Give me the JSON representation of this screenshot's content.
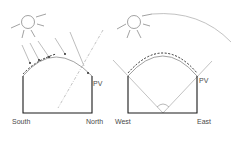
{
  "diagrams": [
    {
      "id": "north-south",
      "labels": {
        "left": "South",
        "right": "North",
        "panel": "PV"
      }
    },
    {
      "id": "east-west",
      "labels": {
        "left": "West",
        "right": "East",
        "panel": "PV"
      }
    }
  ],
  "colors": {
    "structure": "#1a1a1a",
    "rays": "#9a9a9a",
    "sun": "#8a8a8a",
    "text": "#4a4a4a"
  }
}
